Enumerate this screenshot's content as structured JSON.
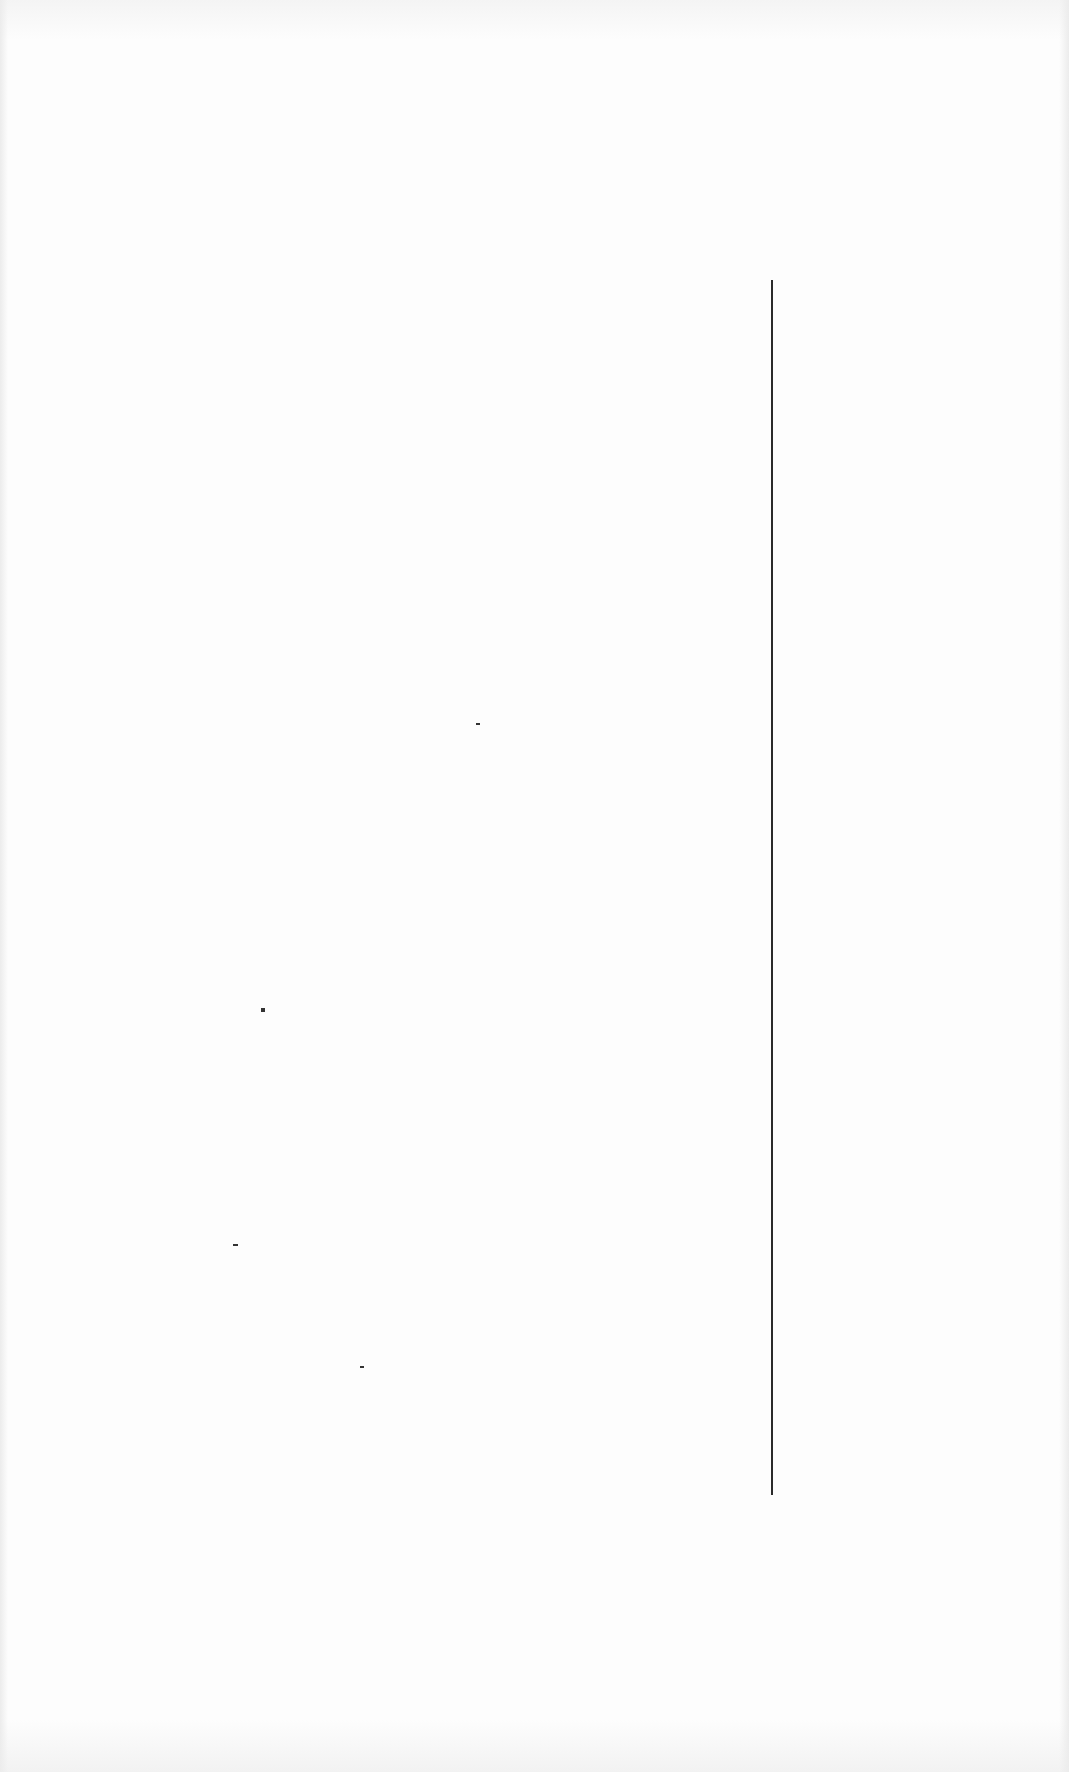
{
  "page": {
    "background": "#fbfbfb",
    "text_content": ""
  },
  "marks": {
    "vertical_rule": {
      "x": 771,
      "top": 280,
      "bottom": 1495,
      "color": "#2a2a2a"
    },
    "specks": [
      {
        "x": 476,
        "y": 723,
        "w": 4,
        "h": 2
      },
      {
        "x": 261,
        "y": 1008,
        "w": 4,
        "h": 4
      },
      {
        "x": 233,
        "y": 1244,
        "w": 5,
        "h": 2
      },
      {
        "x": 360,
        "y": 1366,
        "w": 4,
        "h": 2
      }
    ]
  }
}
